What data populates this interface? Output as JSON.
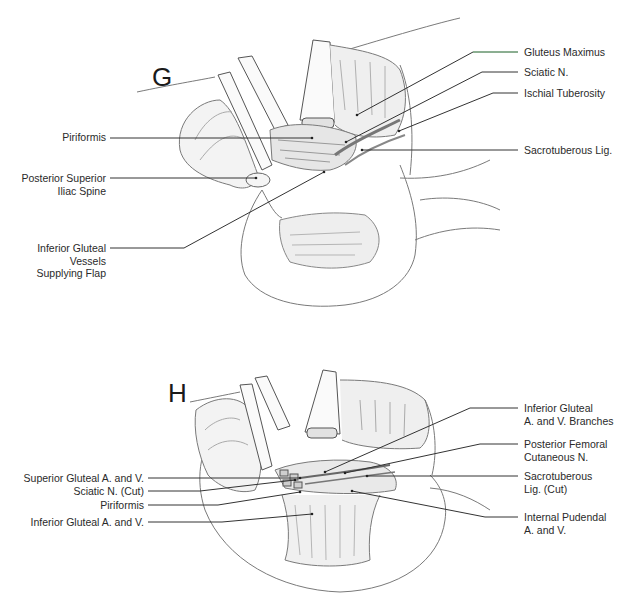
{
  "figure": {
    "panels": [
      {
        "letter": "G",
        "labels_left": [
          {
            "text": "Piriformis"
          },
          {
            "text": "Posterior Superior\nIliac Spine"
          },
          {
            "text": "Inferior Gluteal\nVessels\nSupplying Flap"
          }
        ],
        "labels_right": [
          {
            "text": "Gluteus Maximus"
          },
          {
            "text": "Sciatic N."
          },
          {
            "text": "Ischial Tuberosity"
          },
          {
            "text": "Sacrotuberous Lig."
          }
        ]
      },
      {
        "letter": "H",
        "labels_left": [
          {
            "text": "Superior Gluteal A. and V."
          },
          {
            "text": "Sciatic N. (Cut)"
          },
          {
            "text": "Piriformis"
          },
          {
            "text": "Inferior Gluteal A. and V."
          }
        ],
        "labels_right": [
          {
            "text": "Inferior Gluteal\nA. and V. Branches"
          },
          {
            "text": "Posterior Femoral\nCutaneous N."
          },
          {
            "text": "Sacrotuberous\nLig. (Cut)"
          },
          {
            "text": "Internal Pudendal\nA. and V."
          }
        ]
      }
    ]
  },
  "colors": {
    "line": "#333333",
    "sketch": "#8a8a8a",
    "shade": "#d8d8d8",
    "accent_green": "#7fc48a"
  }
}
